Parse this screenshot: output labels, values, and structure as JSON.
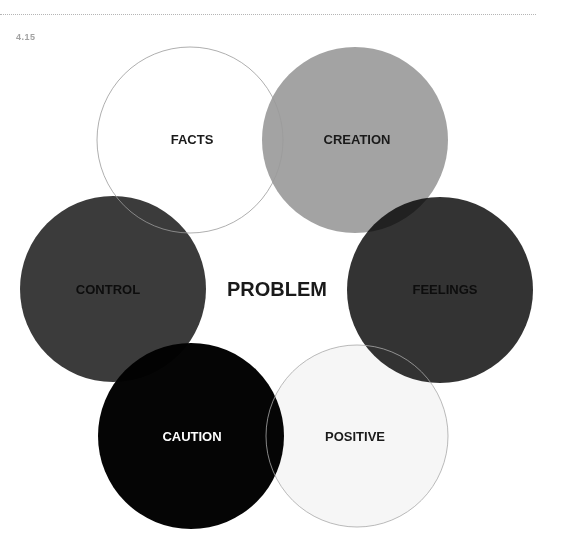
{
  "figure": {
    "number": "4.15",
    "center_label": "PROBLEM"
  },
  "circles": [
    {
      "label": "FACTS",
      "cx": 190,
      "cy": 140,
      "r": 93,
      "fill": "#ffffff",
      "stroke": "#9a9a9a",
      "text_color": "#1a1a1a"
    },
    {
      "label": "CREATION",
      "cx": 355,
      "cy": 140,
      "r": 93,
      "fill": "#a3a3a3",
      "stroke": "none",
      "text_color": "#1a1a1a"
    },
    {
      "label": "FEELINGS",
      "cx": 440,
      "cy": 290,
      "r": 93,
      "fill": "#333333",
      "stroke": "none",
      "text_color": "#0d0d0d"
    },
    {
      "label": "POSITIVE",
      "cx": 357,
      "cy": 436,
      "r": 91,
      "fill": "#f6f6f6",
      "stroke": "#a8a8a8",
      "text_color": "#1a1a1a"
    },
    {
      "label": "CAUTION",
      "cx": 191,
      "cy": 436,
      "r": 93,
      "fill": "#050505",
      "stroke": "none",
      "text_color": "#ffffff"
    },
    {
      "label": "CONTROL",
      "cx": 113,
      "cy": 289,
      "r": 93,
      "fill": "#3b3b3b",
      "stroke": "none",
      "text_color": "#0d0d0d"
    }
  ]
}
